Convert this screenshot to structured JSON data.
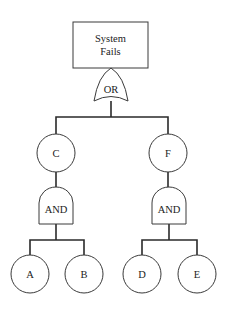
{
  "diagram": {
    "type": "fault-tree",
    "top_event": {
      "label_line1": "System",
      "label_line2": "Fails"
    },
    "top_gate": {
      "type": "OR",
      "label": "OR"
    },
    "intermediate_events": [
      {
        "id": "C",
        "label": "C",
        "gate": {
          "type": "AND",
          "label": "AND"
        },
        "children": [
          "A",
          "B"
        ]
      },
      {
        "id": "F",
        "label": "F",
        "gate": {
          "type": "AND",
          "label": "AND"
        },
        "children": [
          "D",
          "E"
        ]
      }
    ],
    "basic_events": [
      {
        "id": "A",
        "label": "A"
      },
      {
        "id": "B",
        "label": "B"
      },
      {
        "id": "D",
        "label": "D"
      },
      {
        "id": "E",
        "label": "E"
      }
    ],
    "colors": {
      "line": "#2a2a2a",
      "background": "#ffffff",
      "text": "#222222"
    }
  }
}
